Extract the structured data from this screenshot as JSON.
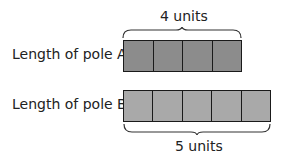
{
  "diagram": {
    "pole_a": {
      "label": "Length of pole A",
      "units": 4,
      "unit_label": "4 units",
      "fill": "#8c8c8c"
    },
    "pole_b": {
      "label": "Length of pole B",
      "units": 5,
      "unit_label": "5 units",
      "fill": "#a9a9a9"
    }
  }
}
